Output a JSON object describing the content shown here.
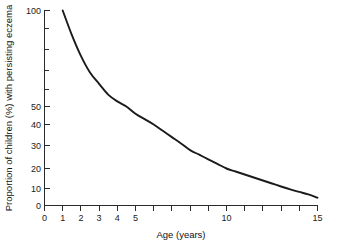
{
  "chart_data": {
    "type": "line",
    "title": "",
    "xlabel": "Age (years)",
    "ylabel": "Proportion of children (%) with persisting eczema",
    "xlim": [
      0,
      15
    ],
    "ylim": [
      0,
      100
    ],
    "yscale": "log-like",
    "grid": false,
    "legend": null,
    "x_ticks_major": [
      0,
      1,
      2,
      3,
      4,
      5,
      10,
      15
    ],
    "x_tick_labels": [
      "0",
      "1",
      "2",
      "3",
      "4",
      "5",
      "10",
      "15"
    ],
    "x_ticks_all": [
      0,
      1,
      2,
      3,
      4,
      5,
      6,
      7,
      8,
      9,
      10,
      11,
      12,
      13,
      14,
      15
    ],
    "y_ticks_major": [
      0,
      10,
      20,
      30,
      40,
      50,
      100
    ],
    "y_tick_labels": [
      "0",
      "10",
      "20",
      "30",
      "40",
      "50",
      "100"
    ],
    "y_ticks_minor": [
      60,
      70,
      80,
      90
    ],
    "series": [
      {
        "name": "persisting eczema",
        "x": [
          1,
          1.5,
          2,
          2.5,
          3,
          3.5,
          4,
          4.5,
          5,
          5.5,
          6,
          6.5,
          7,
          7.5,
          8,
          8.5,
          9,
          9.5,
          10,
          10.5,
          11,
          11.5,
          12,
          12.5,
          13,
          13.5,
          14,
          14.5,
          15
        ],
        "values": [
          100,
          87,
          77,
          69,
          63,
          57,
          53,
          50,
          46,
          43,
          40,
          37,
          34,
          31,
          28,
          26,
          24,
          22,
          20,
          18.5,
          17,
          15.5,
          14,
          12.5,
          11,
          9.5,
          8,
          6.5,
          4.6
        ]
      }
    ],
    "annotations": []
  },
  "axes": {
    "x_title": "Age (years)",
    "y_title": "Proportion of children (%) with persisting eczema"
  }
}
